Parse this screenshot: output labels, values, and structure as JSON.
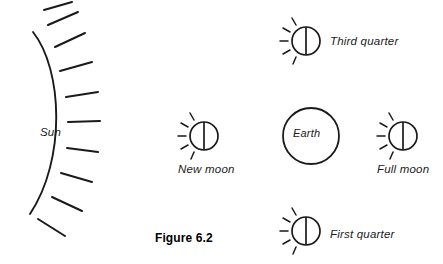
{
  "figure": {
    "caption": "Figure 6.2"
  },
  "labels": {
    "sun": "Sun",
    "earth": "Earth",
    "new_moon": "New moon",
    "full_moon": "Full moon",
    "third_quarter": "Third quarter",
    "first_quarter": "First quarter"
  },
  "colors": {
    "ink": "#1a1a1a",
    "background": "#ffffff",
    "caption": "#000000"
  },
  "diagram": {
    "type": "line-art-diagram",
    "sun": {
      "representation": "arc-with-rays",
      "ray_count": 10,
      "arc_orientation": "convex-right"
    },
    "earth": {
      "representation": "plain-circle",
      "radius_px": 28
    },
    "moons": [
      {
        "name": "third_quarter",
        "cx": 306,
        "cy": 41,
        "r": 14,
        "rays": "left-side",
        "terminator": "vertical"
      },
      {
        "name": "new_moon",
        "cx": 204,
        "cy": 136,
        "r": 14,
        "rays": "left-side",
        "terminator": "vertical"
      },
      {
        "name": "full_moon",
        "cx": 403,
        "cy": 136,
        "r": 14,
        "rays": "left-side",
        "terminator": "vertical"
      },
      {
        "name": "first_quarter",
        "cx": 306,
        "cy": 231,
        "r": 14,
        "rays": "left-side",
        "terminator": "vertical"
      }
    ]
  }
}
